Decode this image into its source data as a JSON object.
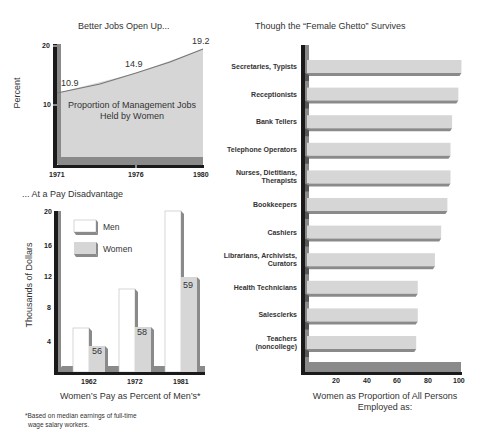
{
  "chart_data": [
    {
      "type": "area",
      "title": "Better Jobs Open Up...",
      "annotation": "Proportion of Management Jobs Held by Women",
      "xlabel": "",
      "ylabel": "Percent",
      "x": [
        "1971",
        "1976",
        "1980"
      ],
      "values": [
        10.9,
        14.9,
        19.2
      ],
      "data_labels": [
        "10.9",
        "14.9",
        "19.2"
      ],
      "yticks": [
        "10",
        "20"
      ],
      "ylim": [
        0,
        20
      ],
      "grid": false,
      "legend": null
    },
    {
      "type": "bar",
      "title": "... At a Pay Disadvantage",
      "xlabel": "Women's Pay as Percent of Men's*",
      "ylabel": "Thousands of Dollars",
      "categories": [
        "1962",
        "1972",
        "1981"
      ],
      "series": [
        {
          "name": "Men",
          "values": [
            5.5,
            10.4,
            20.1
          ]
        },
        {
          "name": "Women",
          "values": [
            3.2,
            5.9,
            12.0
          ]
        }
      ],
      "bar_labels": [
        "56",
        "58",
        "59"
      ],
      "yticks": [
        "4",
        "8",
        "12",
        "16",
        "20"
      ],
      "ylim": [
        0,
        20
      ],
      "grid": false,
      "legend": {
        "position": "upper-left",
        "entries": [
          "Men",
          "Women"
        ]
      },
      "footnote": "*Based on median earnings of full-time wage salary workers."
    },
    {
      "type": "bar",
      "orientation": "horizontal",
      "title": "Though the “Female Ghetto” Survives",
      "xlabel": "Women as Proportion of All Persons Employed as:",
      "ylabel": "",
      "categories": [
        "Secretaries, Typists",
        "Receptionists",
        "Bank Tellers",
        "Telephone Operators",
        "Nurses, Dietitians, Therapists",
        "Bookkeepers",
        "Cashiers",
        "Librarians, Archivists, Curators",
        "Health Technicians",
        "Salesclerks",
        "Teachers (noncollege)"
      ],
      "values": [
        99,
        97,
        93,
        92,
        92,
        90,
        86,
        82,
        71,
        71,
        70
      ],
      "xticks": [
        "20",
        "40",
        "60",
        "80",
        "100"
      ],
      "xlim": [
        0,
        100
      ],
      "grid": false,
      "legend": null
    }
  ],
  "line_chart": {
    "title": "Better Jobs Open Up...",
    "ylabel": "Percent",
    "yticks": [
      "20",
      "10"
    ],
    "xticks": [
      "1971",
      "1976",
      "1980"
    ],
    "points": [
      "10.9",
      "14.9",
      "19.2"
    ],
    "annotation_line1": "Proportion of Management Jobs",
    "annotation_line2": "Held by Women"
  },
  "pay_chart": {
    "title": "... At a Pay Disadvantage",
    "ylabel": "Thousands of Dollars",
    "yticks": [
      "20",
      "16",
      "12",
      "8",
      "4"
    ],
    "xticks": [
      "1962",
      "1972",
      "1981"
    ],
    "legend_men": "Men",
    "legend_women": "Women",
    "pct_labels": [
      "56",
      "58",
      "59"
    ],
    "caption": "Women’s Pay as Percent of Men’s*",
    "footnote_line1": "*Based on median earnings of full-time",
    "footnote_line2": "wage salary workers."
  },
  "ghetto_chart": {
    "title": "Though the “Female Ghetto” Survives",
    "labels": [
      [
        "Secretaries, Typists"
      ],
      [
        "Receptionists"
      ],
      [
        "Bank Tellers"
      ],
      [
        "Telephone Operators"
      ],
      [
        "Nurses, Dietitians,",
        "Therapists"
      ],
      [
        "Bookkeepers"
      ],
      [
        "Cashiers"
      ],
      [
        "Librarians, Archivists,",
        "Curators"
      ],
      [
        "Health Technicians"
      ],
      [
        "Salesclerks"
      ],
      [
        "Teachers",
        "(noncollege)"
      ]
    ],
    "xticks": [
      "20",
      "40",
      "60",
      "80",
      "100"
    ],
    "caption_line1": "Women as Proportion of All Persons",
    "caption_line2": "Employed as:"
  },
  "colors": {
    "axis_dark": "#1a1a1a",
    "shadow": "#8a8a8a",
    "fill_light": "#d4d4d4",
    "bar_white": "#ffffff",
    "text": "#333333"
  }
}
